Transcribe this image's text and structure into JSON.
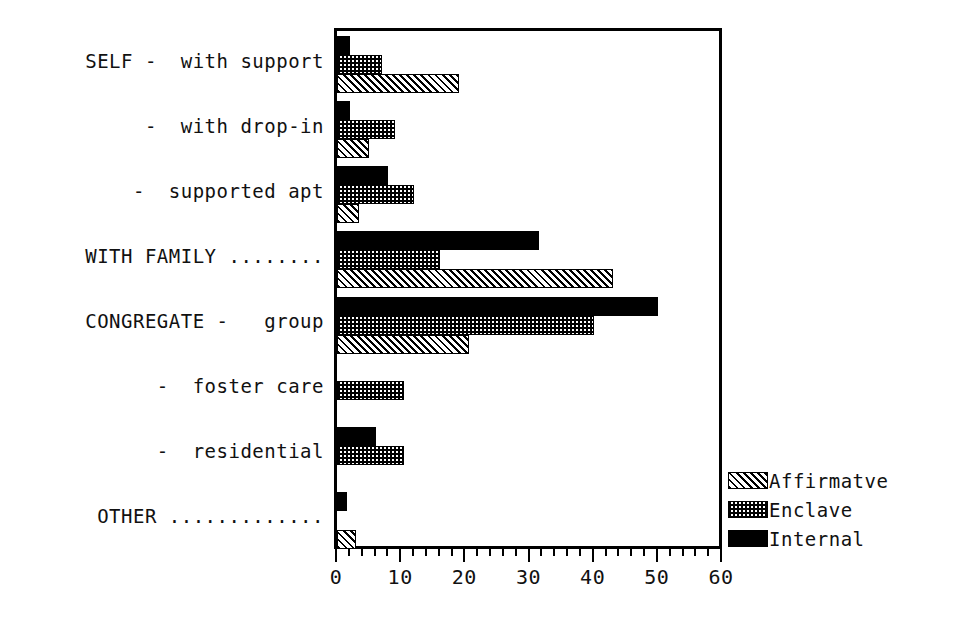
{
  "chart_data": {
    "type": "bar",
    "orientation": "horizontal",
    "title": "",
    "xlabel": "",
    "ylabel": "",
    "xlim": [
      0,
      60
    ],
    "grid": false,
    "legend_position": "right-bottom",
    "x_ticks": [
      0,
      10,
      20,
      30,
      40,
      50,
      60
    ],
    "x_tick_labels": [
      "0",
      "10",
      "20",
      "30",
      "40",
      "50",
      "60"
    ],
    "x_minor_tick_step": 2,
    "categories": [
      "SELF -  with support",
      "-  with drop-in",
      "-  supported apt",
      "WITH FAMILY ........",
      "CONGREGATE -   group",
      "-  foster care",
      "-  residential",
      "OTHER ............."
    ],
    "series": [
      {
        "name": "Internal",
        "pattern": "solid-black",
        "color": "#000000",
        "values": [
          2,
          2,
          8,
          31.5,
          50,
          0,
          6,
          1.5
        ]
      },
      {
        "name": "Enclave",
        "pattern": "checkerboard",
        "color": "#000000",
        "values": [
          7,
          9,
          12,
          16,
          40,
          10.5,
          10.5,
          0
        ]
      },
      {
        "name": "Affirmatve",
        "pattern": "diagonal-hatch",
        "color": "#000000",
        "values": [
          19,
          5,
          3.5,
          43,
          20.5,
          0,
          0,
          3
        ]
      }
    ]
  },
  "legend": {
    "items": [
      {
        "label": "Affirmatve",
        "pattern": "affirmative"
      },
      {
        "label": "Enclave",
        "pattern": "enclave"
      },
      {
        "label": "Internal",
        "pattern": "internal"
      }
    ]
  }
}
